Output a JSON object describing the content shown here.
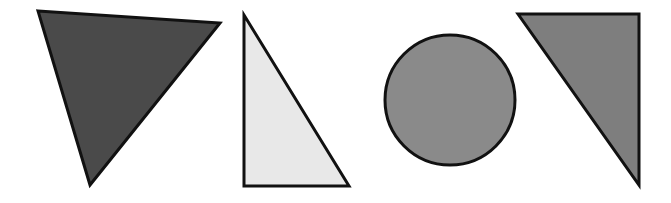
{
  "figure": {
    "width": 671,
    "height": 203,
    "background": "#ffffff",
    "stroke_color": "#111111",
    "stroke_width": 3
  },
  "shapes": [
    {
      "id": "dark-triangle",
      "type": "triangle",
      "points": "38,11 220,23 90,185",
      "fill": "#4a4a4a"
    },
    {
      "id": "light-right-triangle",
      "type": "triangle",
      "points": "244,15 244,186 349,186",
      "fill": "#e8e8e8"
    },
    {
      "id": "gray-circle",
      "type": "circle",
      "cx": 450,
      "cy": 100,
      "r": 65,
      "fill": "#8a8a8a"
    },
    {
      "id": "gray-right-triangle",
      "type": "triangle",
      "points": "518,14 639,14 639,185",
      "fill": "#7e7e7e"
    }
  ]
}
